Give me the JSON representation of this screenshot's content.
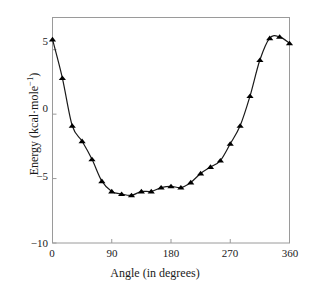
{
  "chart_data": {
    "type": "line",
    "title": "",
    "subtitle": "",
    "xlabel": "Angle (in degrees)",
    "ylabel_prefix": "Energy (kcal·mole",
    "ylabel_sup": "−1",
    "ylabel_suffix": ")",
    "ylabel": "Energy (kcal·mole⁻¹)",
    "xlim": [
      0,
      360
    ],
    "ylim": [
      -10,
      7.5
    ],
    "xticks": [
      0,
      90,
      180,
      270,
      360
    ],
    "xtick_labels": [
      "0",
      "90",
      "180",
      "270",
      "360"
    ],
    "yticks": [
      5,
      0,
      -5,
      -10
    ],
    "ytick_labels": [
      "5",
      "0",
      "−5",
      "−10"
    ],
    "grid": false,
    "legend": false,
    "marker": "triangle-up",
    "marker_color": "#000000",
    "line_color": "#1a1a1a",
    "frame_color": "#9a9a9a",
    "background": "#ffffff",
    "series": [
      {
        "name": "torsional energy",
        "x": [
          0,
          15,
          30,
          45,
          60,
          75,
          90,
          105,
          120,
          135,
          150,
          165,
          180,
          195,
          210,
          225,
          240,
          255,
          270,
          285,
          300,
          315,
          330,
          345,
          360
        ],
        "values": [
          5.8,
          2.8,
          -0.9,
          -2.1,
          -3.5,
          -5.2,
          -6.0,
          -6.2,
          -6.3,
          -6.0,
          -6.0,
          -5.7,
          -5.6,
          -5.7,
          -5.3,
          -4.6,
          -4.1,
          -3.6,
          -2.3,
          -0.9,
          1.4,
          4.2,
          5.9,
          6.0,
          5.5
        ]
      }
    ]
  }
}
